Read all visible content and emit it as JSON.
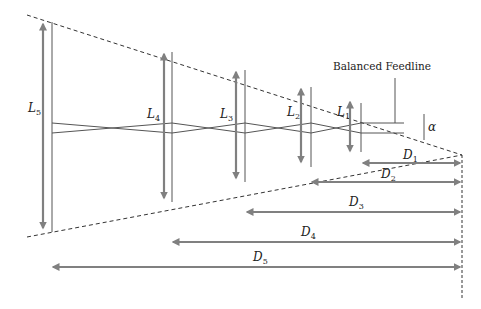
{
  "diagram": {
    "feedline_label": "Balanced Feedline",
    "angle_label": "α",
    "colors": {
      "arrow": "#808080",
      "element": "#555555",
      "dashed": "#333333",
      "text": "#222222"
    },
    "elements": [
      {
        "id": "L1",
        "base": "L",
        "sub": "1"
      },
      {
        "id": "L2",
        "base": "L",
        "sub": "2"
      },
      {
        "id": "L3",
        "base": "L",
        "sub": "3"
      },
      {
        "id": "L4",
        "base": "L",
        "sub": "4"
      },
      {
        "id": "L5",
        "base": "L",
        "sub": "5"
      }
    ],
    "distances": [
      {
        "id": "D1",
        "base": "D",
        "sub": "1"
      },
      {
        "id": "D2",
        "base": "D",
        "sub": "2"
      },
      {
        "id": "D3",
        "base": "D",
        "sub": "3"
      },
      {
        "id": "D4",
        "base": "D",
        "sub": "4"
      },
      {
        "id": "D5",
        "base": "D",
        "sub": "5"
      }
    ]
  }
}
